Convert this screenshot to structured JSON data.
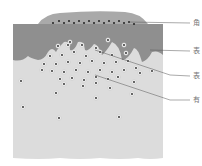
{
  "diagram": {
    "type": "tissue-cross-section",
    "colors": {
      "background": "#ffffff",
      "top_layer": "#a9a9a9",
      "epidermis": "#8f8f8f",
      "dermis": "#dcdcdc",
      "cell_fill": "#f4f4f4",
      "cell_nucleus": "#222222",
      "leader_line": "#555555",
      "label_text": "#777777"
    },
    "labels": [
      {
        "id": "label-1",
        "text": "角",
        "y": 23
      },
      {
        "id": "label-2",
        "text": "表",
        "y": 52
      },
      {
        "id": "label-3",
        "text": "表",
        "y": 76
      },
      {
        "id": "label-4",
        "text": "有",
        "y": 100
      }
    ]
  }
}
